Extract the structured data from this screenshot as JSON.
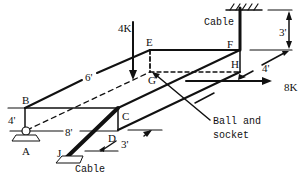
{
  "diagram": {
    "points": {
      "A": "A",
      "B": "B",
      "C": "C",
      "D": "D",
      "E": "E",
      "F": "F",
      "G": "G",
      "H": "H",
      "J": "J"
    },
    "dimensions": {
      "ab": "4'",
      "ad": "8'",
      "be": "6'",
      "top": "3'",
      "h": "4'",
      "d": "3'"
    },
    "loads": {
      "vertical": "4K",
      "horizontal": "8K"
    },
    "annotations": {
      "cable_top": "Cable",
      "cable_bottom": "Cable",
      "ball_line1": "Ball and",
      "ball_line2": "socket"
    }
  }
}
